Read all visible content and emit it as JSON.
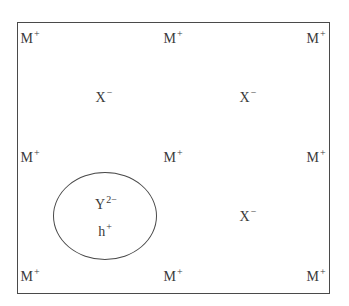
{
  "diagram": {
    "colors": {
      "line": "#4a4a4a",
      "text": "#3a3a3a",
      "background": "#ffffff"
    },
    "cations": [
      {
        "symbol": "M",
        "charge": "+",
        "position": "top-left"
      },
      {
        "symbol": "M",
        "charge": "+",
        "position": "top-center"
      },
      {
        "symbol": "M",
        "charge": "+",
        "position": "top-right"
      },
      {
        "symbol": "M",
        "charge": "+",
        "position": "middle-left"
      },
      {
        "symbol": "M",
        "charge": "+",
        "position": "center"
      },
      {
        "symbol": "M",
        "charge": "+",
        "position": "middle-right"
      },
      {
        "symbol": "M",
        "charge": "+",
        "position": "bottom-left"
      },
      {
        "symbol": "M",
        "charge": "+",
        "position": "bottom-center"
      },
      {
        "symbol": "M",
        "charge": "+",
        "position": "bottom-right"
      }
    ],
    "anions": [
      {
        "symbol": "X",
        "charge": "−",
        "position": "upper-left-interstitial"
      },
      {
        "symbol": "X",
        "charge": "−",
        "position": "upper-right-interstitial"
      },
      {
        "symbol": "X",
        "charge": "−",
        "position": "lower-right-interstitial"
      }
    ],
    "defect": {
      "impurity": {
        "symbol": "Y",
        "charge": "2−"
      },
      "hole": {
        "symbol": "h",
        "charge": "+"
      },
      "position": "lower-left-interstitial"
    }
  }
}
